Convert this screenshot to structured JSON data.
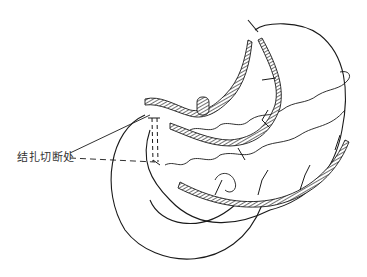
{
  "figure": {
    "top_fragment": "",
    "annotation_label": "结扎切断处",
    "colors": {
      "ink": "#1a1a1a",
      "background": "#ffffff"
    }
  }
}
